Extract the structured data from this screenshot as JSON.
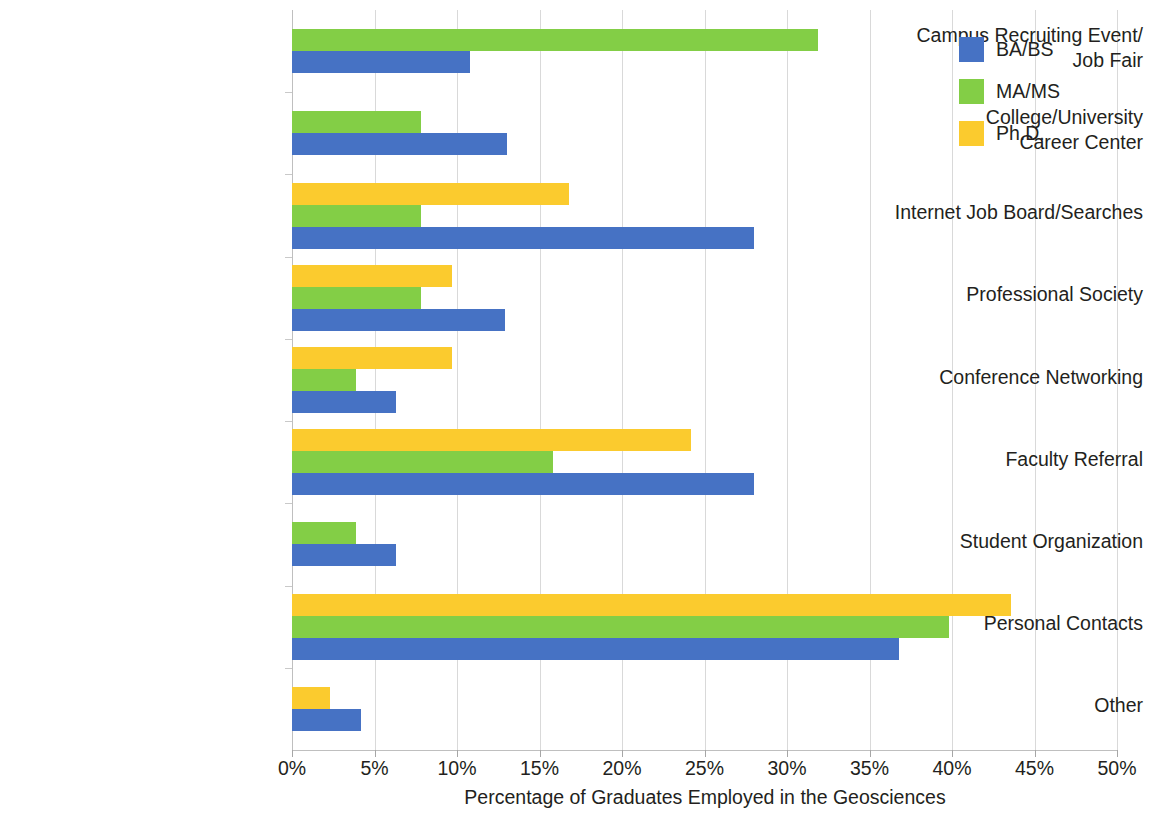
{
  "chart_data": {
    "type": "bar",
    "orientation": "horizontal",
    "title": "",
    "xlabel": "Percentage of Graduates Employed in the Geosciences",
    "ylabel": "",
    "xlim": [
      0,
      50
    ],
    "xtick_labels": [
      "0%",
      "5%",
      "10%",
      "15%",
      "20%",
      "25%",
      "30%",
      "35%",
      "40%",
      "45%",
      "50%"
    ],
    "xticks": [
      0,
      5,
      10,
      15,
      20,
      25,
      30,
      35,
      40,
      45,
      50
    ],
    "grid": "vertical",
    "legend_position": "top-right",
    "categories": [
      "Campus Recruiting Event/\nJob Fair",
      "College/University\nCareer Center",
      "Internet Job Board/Searches",
      "Professional Society",
      "Conference Networking",
      "Faculty Referral",
      "Student Organization",
      "Personal Contacts",
      "Other"
    ],
    "series": [
      {
        "name": "BA/BS",
        "color": "#4672c4",
        "values": [
          10.8,
          13.0,
          28.0,
          12.9,
          6.3,
          28.0,
          6.3,
          36.8,
          4.2
        ]
      },
      {
        "name": "MA/MS",
        "color": "#83ce46",
        "values": [
          31.9,
          7.8,
          7.8,
          7.8,
          3.9,
          15.8,
          3.9,
          39.8,
          0
        ]
      },
      {
        "name": "Ph.D.",
        "color": "#fbcb2e",
        "values": [
          0,
          0,
          16.8,
          9.7,
          9.7,
          24.2,
          0,
          43.6,
          2.3
        ]
      }
    ]
  },
  "legend": {
    "items": [
      {
        "label": "BA/BS",
        "color": "#4672c4"
      },
      {
        "label": "MA/MS",
        "color": "#83ce46"
      },
      {
        "label": "Ph.D.",
        "color": "#fbcb2e"
      }
    ]
  },
  "axis": {
    "x_title": "Percentage of Graduates Employed in the Geosciences"
  }
}
